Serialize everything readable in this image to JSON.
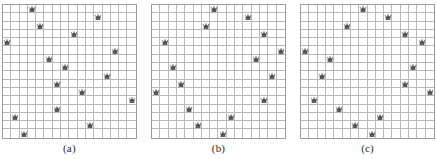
{
  "figure": {
    "board_size": 16,
    "queens_per_board": 16,
    "colors": {
      "board_background": "#ffffff",
      "grid_line": "#b9b9b9",
      "board_border": "#9b9b9b",
      "queen_fill": "#2b2b2b",
      "queen_shade": "#7d7d7d",
      "caption_text": "#2a2a2a",
      "page_background": "#ffffff"
    }
  },
  "panels": [
    {
      "id": "panel-a",
      "caption": "(a)",
      "board_size": 16,
      "queen_icon": "queen-chess-piece-icon",
      "queens": [
        {
          "row": 1,
          "col": 4
        },
        {
          "row": 2,
          "col": 12
        },
        {
          "row": 3,
          "col": 5
        },
        {
          "row": 4,
          "col": 9
        },
        {
          "row": 5,
          "col": 1
        },
        {
          "row": 6,
          "col": 14
        },
        {
          "row": 7,
          "col": 6
        },
        {
          "row": 8,
          "col": 8
        },
        {
          "row": 9,
          "col": 13
        },
        {
          "row": 10,
          "col": 7
        },
        {
          "row": 11,
          "col": 10
        },
        {
          "row": 12,
          "col": 16
        },
        {
          "row": 13,
          "col": 7
        },
        {
          "row": 14,
          "col": 2
        },
        {
          "row": 15,
          "col": 11
        },
        {
          "row": 16,
          "col": 3
        }
      ]
    },
    {
      "id": "panel-b",
      "caption": "(b)",
      "board_size": 16,
      "queen_icon": "queen-chess-piece-icon",
      "queens": [
        {
          "row": 1,
          "col": 8
        },
        {
          "row": 2,
          "col": 12
        },
        {
          "row": 3,
          "col": 7
        },
        {
          "row": 4,
          "col": 14
        },
        {
          "row": 5,
          "col": 2
        },
        {
          "row": 6,
          "col": 16
        },
        {
          "row": 7,
          "col": 13
        },
        {
          "row": 8,
          "col": 3
        },
        {
          "row": 9,
          "col": 15
        },
        {
          "row": 10,
          "col": 4
        },
        {
          "row": 11,
          "col": 1
        },
        {
          "row": 12,
          "col": 14
        },
        {
          "row": 13,
          "col": 5
        },
        {
          "row": 14,
          "col": 10
        },
        {
          "row": 15,
          "col": 6
        },
        {
          "row": 16,
          "col": 9
        }
      ]
    },
    {
      "id": "panel-c",
      "caption": "(c)",
      "board_size": 16,
      "queen_icon": "queen-chess-piece-icon",
      "queens": [
        {
          "row": 1,
          "col": 8
        },
        {
          "row": 2,
          "col": 11
        },
        {
          "row": 3,
          "col": 6
        },
        {
          "row": 4,
          "col": 13
        },
        {
          "row": 5,
          "col": 15
        },
        {
          "row": 6,
          "col": 1
        },
        {
          "row": 7,
          "col": 4
        },
        {
          "row": 8,
          "col": 14
        },
        {
          "row": 9,
          "col": 3
        },
        {
          "row": 10,
          "col": 13
        },
        {
          "row": 11,
          "col": 16
        },
        {
          "row": 12,
          "col": 2
        },
        {
          "row": 13,
          "col": 5
        },
        {
          "row": 14,
          "col": 10
        },
        {
          "row": 15,
          "col": 7
        },
        {
          "row": 16,
          "col": 9
        }
      ]
    }
  ]
}
